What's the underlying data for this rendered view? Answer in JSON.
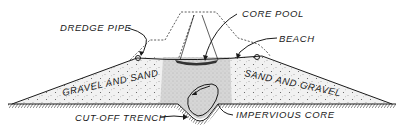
{
  "diagram": {
    "type": "cross-section",
    "labels": {
      "dredge_pipe": "DREDGE PIPE",
      "core_pool": "CORE POOL",
      "beach": "BEACH",
      "gravel_and_sand": "GRAVEL AND SAND",
      "sand_and_gravel": "SAND AND GRAVEL",
      "cut_off_trench": "CUT-OFF TRENCH",
      "impervious_core": "IMPERVIOUS CORE"
    },
    "colors": {
      "ink": "#1a1a1a",
      "fill_shell": "#ededed",
      "fill_core": "#d4d4d4",
      "background": "#ffffff"
    }
  }
}
